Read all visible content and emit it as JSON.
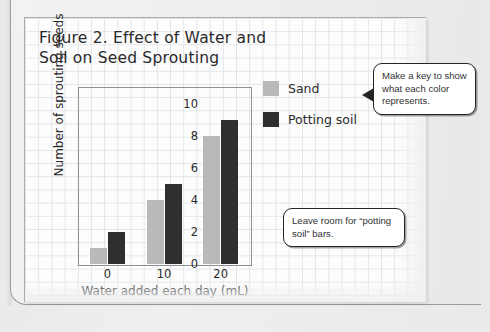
{
  "chart_data": {
    "type": "bar",
    "title": "Figure 2. Effect of Water and Soil on Seed Sprouting",
    "xlabel": "Water added each day (mL)",
    "ylabel": "Number of sprouting seeds",
    "categories": [
      "0",
      "10",
      "20"
    ],
    "series": [
      {
        "name": "Sand",
        "values": [
          1,
          4,
          8
        ],
        "color": "#b9b9b9"
      },
      {
        "name": "Potting soil",
        "values": [
          2,
          5,
          9
        ],
        "color": "#2f2f2f"
      }
    ],
    "ylim": [
      0,
      11
    ],
    "yticks": [
      "0",
      "2",
      "4",
      "6",
      "8",
      "10"
    ],
    "ytick_values": [
      0,
      2,
      4,
      6,
      8,
      10
    ],
    "grid": true,
    "legend_position": "right"
  },
  "legend": {
    "items": [
      {
        "label": "Sand",
        "color": "#b9b9b9"
      },
      {
        "label": "Potting soil",
        "color": "#2f2f2f"
      }
    ]
  },
  "callouts": {
    "key": "Make a key to show what each color represents.",
    "room": "Leave room for “potting soil” bars."
  }
}
